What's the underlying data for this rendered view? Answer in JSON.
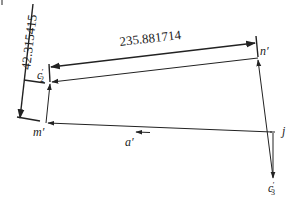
{
  "diagram": {
    "dimensions": {
      "horizontal": "235.881714",
      "vertical": "42.315415"
    },
    "points": {
      "c2": {
        "label": "c",
        "sub": "2",
        "prime": "′"
      },
      "n": {
        "label": "n′"
      },
      "m": {
        "label": "m′"
      },
      "a": {
        "label": "a′"
      },
      "j": {
        "label": "j"
      },
      "c3": {
        "label": "c",
        "sub": "3",
        "prime": "′"
      }
    },
    "colors": {
      "line": "#222222",
      "background": "#ffffff"
    }
  }
}
